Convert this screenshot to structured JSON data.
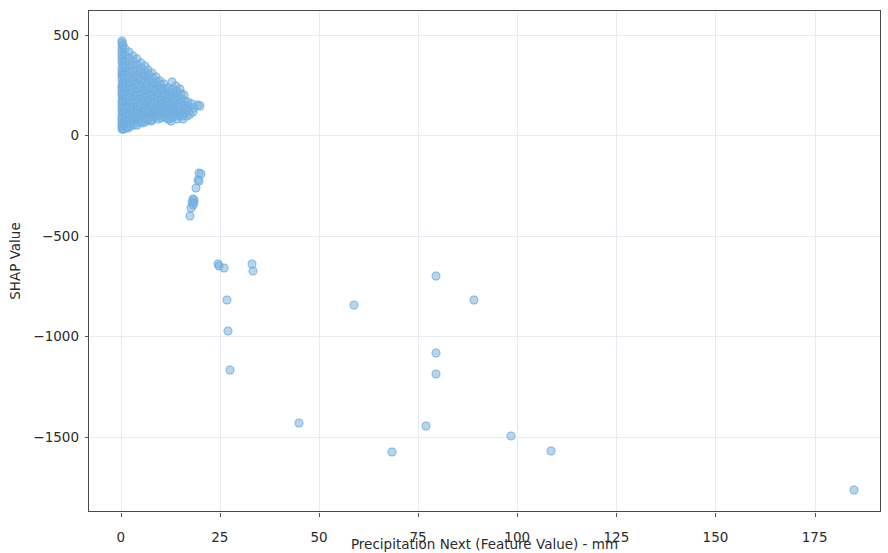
{
  "chart_data": {
    "type": "scatter",
    "title": "",
    "xlabel": "Precipitation Next (Feature Value) - mm",
    "ylabel": "SHAP Value",
    "xlim": [
      -8,
      192
    ],
    "ylim": [
      -1880,
      620
    ],
    "xticks": [
      0,
      25,
      50,
      75,
      100,
      125,
      150,
      175
    ],
    "xticklabels": [
      "0",
      "25",
      "50",
      "75",
      "100",
      "125",
      "150",
      "175"
    ],
    "yticks": [
      500,
      0,
      -500,
      -1000,
      -1500
    ],
    "yticklabels": [
      "500",
      "0",
      "−500",
      "−1000",
      "−1500"
    ],
    "grid": true,
    "legend": null,
    "marker": {
      "color": "#78b4e1",
      "edge_color": "#6caadc",
      "alpha": 0.55,
      "size_px": 9
    },
    "series": [
      {
        "name": "SHAP values",
        "points": [
          [
            0.2,
            460
          ],
          [
            0.2,
            440
          ],
          [
            0.3,
            425
          ],
          [
            0.4,
            470
          ],
          [
            0.5,
            452
          ],
          [
            0.2,
            410
          ],
          [
            0.3,
            395
          ],
          [
            0.4,
            380
          ],
          [
            0.2,
            365
          ],
          [
            0.5,
            350
          ],
          [
            0.3,
            335
          ],
          [
            0.2,
            320
          ],
          [
            0.4,
            305
          ],
          [
            0.3,
            290
          ],
          [
            0.2,
            275
          ],
          [
            0.5,
            262
          ],
          [
            0.3,
            248
          ],
          [
            0.2,
            235
          ],
          [
            0.4,
            222
          ],
          [
            0.3,
            208
          ],
          [
            0.2,
            196
          ],
          [
            0.5,
            184
          ],
          [
            0.3,
            172
          ],
          [
            0.2,
            160
          ],
          [
            0.4,
            148
          ],
          [
            0.3,
            136
          ],
          [
            0.2,
            124
          ],
          [
            0.5,
            112
          ],
          [
            0.3,
            100
          ],
          [
            0.2,
            88
          ],
          [
            0.4,
            76
          ],
          [
            0.3,
            64
          ],
          [
            0.2,
            52
          ],
          [
            0.4,
            40
          ],
          [
            0.3,
            33
          ],
          [
            0.6,
            30
          ],
          [
            0.8,
            34
          ],
          [
            0.5,
            300
          ],
          [
            0.6,
            250
          ],
          [
            0.7,
            200
          ],
          [
            1.0,
            430
          ],
          [
            1.1,
            400
          ],
          [
            1.2,
            372
          ],
          [
            1.0,
            345
          ],
          [
            1.3,
            322
          ],
          [
            1.1,
            300
          ],
          [
            1.2,
            280
          ],
          [
            1.0,
            258
          ],
          [
            1.4,
            240
          ],
          [
            1.2,
            220
          ],
          [
            1.1,
            200
          ],
          [
            1.3,
            182
          ],
          [
            1.0,
            164
          ],
          [
            1.5,
            148
          ],
          [
            1.2,
            130
          ],
          [
            1.1,
            114
          ],
          [
            1.3,
            98
          ],
          [
            1.0,
            82
          ],
          [
            1.4,
            68
          ],
          [
            1.2,
            54
          ],
          [
            1.6,
            44
          ],
          [
            1.8,
            38
          ],
          [
            2.0,
            415
          ],
          [
            2.1,
            388
          ],
          [
            2.2,
            360
          ],
          [
            2.0,
            335
          ],
          [
            2.3,
            312
          ],
          [
            2.1,
            290
          ],
          [
            2.4,
            268
          ],
          [
            2.2,
            248
          ],
          [
            2.0,
            228
          ],
          [
            2.5,
            210
          ],
          [
            2.2,
            192
          ],
          [
            2.1,
            174
          ],
          [
            2.3,
            156
          ],
          [
            2.0,
            138
          ],
          [
            2.6,
            122
          ],
          [
            2.2,
            106
          ],
          [
            2.4,
            90
          ],
          [
            2.1,
            74
          ],
          [
            2.3,
            58
          ],
          [
            2.7,
            46
          ],
          [
            3.0,
            398
          ],
          [
            3.1,
            370
          ],
          [
            3.2,
            344
          ],
          [
            3.0,
            320
          ],
          [
            3.3,
            298
          ],
          [
            3.1,
            276
          ],
          [
            3.4,
            256
          ],
          [
            3.2,
            236
          ],
          [
            3.0,
            216
          ],
          [
            3.5,
            198
          ],
          [
            3.2,
            180
          ],
          [
            3.1,
            162
          ],
          [
            3.3,
            144
          ],
          [
            3.0,
            126
          ],
          [
            3.6,
            110
          ],
          [
            3.2,
            94
          ],
          [
            3.4,
            78
          ],
          [
            3.1,
            62
          ],
          [
            3.3,
            50
          ],
          [
            4.0,
            380
          ],
          [
            4.1,
            352
          ],
          [
            4.2,
            326
          ],
          [
            4.0,
            302
          ],
          [
            4.3,
            280
          ],
          [
            4.1,
            258
          ],
          [
            4.4,
            238
          ],
          [
            4.2,
            218
          ],
          [
            4.0,
            198
          ],
          [
            4.5,
            180
          ],
          [
            4.2,
            162
          ],
          [
            4.1,
            144
          ],
          [
            4.3,
            128
          ],
          [
            4.0,
            112
          ],
          [
            4.6,
            96
          ],
          [
            4.2,
            80
          ],
          [
            4.4,
            66
          ],
          [
            4.1,
            54
          ],
          [
            5.0,
            362
          ],
          [
            5.1,
            336
          ],
          [
            5.2,
            310
          ],
          [
            5.0,
            286
          ],
          [
            5.3,
            264
          ],
          [
            5.1,
            242
          ],
          [
            5.4,
            222
          ],
          [
            5.2,
            202
          ],
          [
            5.0,
            184
          ],
          [
            5.5,
            166
          ],
          [
            5.2,
            148
          ],
          [
            5.1,
            132
          ],
          [
            5.3,
            116
          ],
          [
            5.0,
            100
          ],
          [
            5.6,
            86
          ],
          [
            5.2,
            72
          ],
          [
            5.4,
            60
          ],
          [
            6.0,
            345
          ],
          [
            6.1,
            318
          ],
          [
            6.2,
            294
          ],
          [
            6.0,
            270
          ],
          [
            6.3,
            248
          ],
          [
            6.1,
            228
          ],
          [
            6.4,
            208
          ],
          [
            6.2,
            190
          ],
          [
            6.0,
            172
          ],
          [
            6.5,
            154
          ],
          [
            6.2,
            138
          ],
          [
            6.1,
            122
          ],
          [
            6.3,
            106
          ],
          [
            6.0,
            92
          ],
          [
            6.6,
            78
          ],
          [
            6.2,
            66
          ],
          [
            7.0,
            328
          ],
          [
            7.1,
            302
          ],
          [
            7.2,
            278
          ],
          [
            7.0,
            256
          ],
          [
            7.3,
            234
          ],
          [
            7.1,
            214
          ],
          [
            7.4,
            196
          ],
          [
            7.2,
            178
          ],
          [
            7.0,
            160
          ],
          [
            7.5,
            144
          ],
          [
            7.2,
            128
          ],
          [
            7.1,
            112
          ],
          [
            7.3,
            98
          ],
          [
            7.0,
            84
          ],
          [
            7.6,
            72
          ],
          [
            8.0,
            310
          ],
          [
            8.1,
            286
          ],
          [
            8.2,
            262
          ],
          [
            8.0,
            240
          ],
          [
            8.3,
            220
          ],
          [
            8.1,
            200
          ],
          [
            8.4,
            182
          ],
          [
            8.2,
            164
          ],
          [
            8.0,
            148
          ],
          [
            8.5,
            132
          ],
          [
            8.2,
            118
          ],
          [
            8.1,
            104
          ],
          [
            8.3,
            90
          ],
          [
            8.0,
            78
          ],
          [
            9.0,
            292
          ],
          [
            9.1,
            268
          ],
          [
            9.2,
            246
          ],
          [
            9.0,
            226
          ],
          [
            9.3,
            206
          ],
          [
            9.1,
            188
          ],
          [
            9.4,
            170
          ],
          [
            9.2,
            154
          ],
          [
            9.0,
            138
          ],
          [
            9.5,
            124
          ],
          [
            9.2,
            110
          ],
          [
            9.1,
            96
          ],
          [
            9.3,
            84
          ],
          [
            10.0,
            272
          ],
          [
            10.1,
            250
          ],
          [
            10.2,
            230
          ],
          [
            10.0,
            210
          ],
          [
            10.3,
            192
          ],
          [
            10.1,
            174
          ],
          [
            10.4,
            158
          ],
          [
            10.2,
            142
          ],
          [
            10.0,
            128
          ],
          [
            10.5,
            114
          ],
          [
            10.2,
            100
          ],
          [
            10.1,
            88
          ],
          [
            11.0,
            255
          ],
          [
            11.1,
            234
          ],
          [
            11.2,
            214
          ],
          [
            11.0,
            196
          ],
          [
            11.3,
            178
          ],
          [
            11.1,
            162
          ],
          [
            11.4,
            146
          ],
          [
            11.2,
            132
          ],
          [
            11.0,
            118
          ],
          [
            11.5,
            105
          ],
          [
            11.2,
            92
          ],
          [
            11.8,
            80
          ],
          [
            12.0,
            238
          ],
          [
            12.1,
            218
          ],
          [
            12.2,
            200
          ],
          [
            12.0,
            182
          ],
          [
            12.3,
            166
          ],
          [
            12.1,
            150
          ],
          [
            12.4,
            136
          ],
          [
            12.2,
            122
          ],
          [
            12.0,
            108
          ],
          [
            12.5,
            96
          ],
          [
            12.2,
            84
          ],
          [
            12.8,
            72
          ],
          [
            13.0,
            265
          ],
          [
            13.1,
            230
          ],
          [
            13.2,
            205
          ],
          [
            13.0,
            185
          ],
          [
            13.3,
            166
          ],
          [
            13.1,
            150
          ],
          [
            13.4,
            135
          ],
          [
            13.2,
            120
          ],
          [
            13.5,
            105
          ],
          [
            13.2,
            92
          ],
          [
            14.0,
            248
          ],
          [
            14.1,
            222
          ],
          [
            14.2,
            198
          ],
          [
            14.0,
            176
          ],
          [
            14.3,
            158
          ],
          [
            14.1,
            140
          ],
          [
            14.4,
            124
          ],
          [
            14.2,
            108
          ],
          [
            14.5,
            95
          ],
          [
            14.2,
            82
          ],
          [
            15.0,
            230
          ],
          [
            15.2,
            205
          ],
          [
            15.1,
            180
          ],
          [
            15.3,
            160
          ],
          [
            15.0,
            142
          ],
          [
            15.4,
            125
          ],
          [
            15.2,
            108
          ],
          [
            15.5,
            95
          ],
          [
            15.8,
            83
          ],
          [
            16.0,
            200
          ],
          [
            16.3,
            172
          ],
          [
            16.1,
            150
          ],
          [
            16.5,
            130
          ],
          [
            16.2,
            112
          ],
          [
            16.8,
            95
          ],
          [
            17.0,
            165
          ],
          [
            17.3,
            142
          ],
          [
            17.1,
            122
          ],
          [
            17.5,
            105
          ],
          [
            18.0,
            158
          ],
          [
            18.4,
            135
          ],
          [
            18.2,
            115
          ],
          [
            19.5,
            150
          ],
          [
            20.0,
            145
          ],
          [
            19.8,
            -185
          ],
          [
            20.2,
            -192
          ],
          [
            19.5,
            -220
          ],
          [
            19.8,
            -228
          ],
          [
            19.0,
            -262
          ],
          [
            18.3,
            -315
          ],
          [
            18.0,
            -330
          ],
          [
            18.6,
            -322
          ],
          [
            18.2,
            -348
          ],
          [
            17.8,
            -362
          ],
          [
            18.5,
            -338
          ],
          [
            17.5,
            -400
          ],
          [
            24.5,
            -640
          ],
          [
            24.8,
            -648
          ],
          [
            26.0,
            -662
          ],
          [
            26.8,
            -818
          ],
          [
            27.1,
            -975
          ],
          [
            27.6,
            -1168
          ],
          [
            33.0,
            -640
          ],
          [
            33.3,
            -675
          ],
          [
            45.0,
            -1430
          ],
          [
            58.8,
            -845
          ],
          [
            68.5,
            -1578
          ],
          [
            77.0,
            -1445
          ],
          [
            79.5,
            -700
          ],
          [
            79.6,
            -1085
          ],
          [
            79.6,
            -1190
          ],
          [
            89.0,
            -820
          ],
          [
            98.5,
            -1498
          ],
          [
            108.5,
            -1572
          ],
          [
            185.0,
            -1765
          ]
        ]
      }
    ]
  },
  "axes": {
    "xaxis_title": "Precipitation Next (Feature Value) - mm",
    "yaxis_title": "SHAP Value"
  }
}
